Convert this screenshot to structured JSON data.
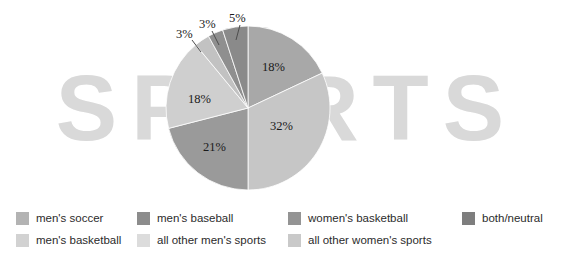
{
  "watermark": {
    "text": "SPORTS",
    "color": "#d9d9d9"
  },
  "chart_data": {
    "type": "pie",
    "title": "",
    "subtitle": "",
    "xlabel": "",
    "ylabel": "",
    "legend_position": "bottom",
    "grid": false,
    "start_angle_deg": 0,
    "direction": "clockwise",
    "categories": [
      "men's soccer",
      "men's baseball",
      "women's basketball",
      "both/neutral",
      "men's basketball",
      "all other men's sports",
      "all other women's sports"
    ],
    "slices": [
      {
        "label": "men's soccer",
        "value": 18,
        "display": "18%",
        "color": "#a8a8a8"
      },
      {
        "label": "men's baseball",
        "value": 32,
        "display": "32%",
        "color": "#c6c6c6"
      },
      {
        "label": "women's basketball",
        "value": 21,
        "display": "21%",
        "color": "#9a9a9a"
      },
      {
        "label": "both/neutral",
        "value": 18,
        "display": "18%",
        "color": "#cfcfcf"
      },
      {
        "label": "men's basketball",
        "value": 3,
        "display": "3%",
        "color": "#c2c2c2"
      },
      {
        "label": "all other men's sports",
        "value": 3,
        "display": "3%",
        "color": "#8f8f8f"
      },
      {
        "label": "all other women's sports",
        "value": 5,
        "display": "5%",
        "color": "#8a8a8a"
      }
    ],
    "values": [
      18,
      32,
      21,
      18,
      3,
      3,
      5
    ],
    "callouts": [
      {
        "display": "3%"
      },
      {
        "display": "3%"
      },
      {
        "display": "5%"
      }
    ]
  },
  "legend": {
    "entries": [
      {
        "label": "men's soccer",
        "color": "#b3b3b3"
      },
      {
        "label": "men's basketball",
        "color": "#d2d2d2"
      },
      {
        "label": "men's baseball",
        "color": "#8c8c8c"
      },
      {
        "label": "all other men's sports",
        "color": "#dcdcdc"
      },
      {
        "label": "women's basketball",
        "color": "#949494"
      },
      {
        "label": "all other women's sports",
        "color": "#c9c9c9"
      },
      {
        "label": "both/neutral",
        "color": "#7e7e7e"
      }
    ]
  }
}
